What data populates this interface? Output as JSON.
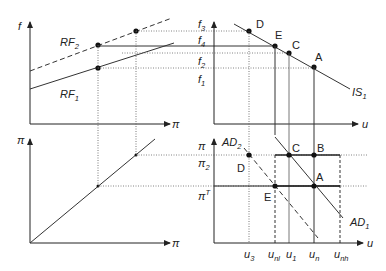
{
  "panels": {
    "top_left": {
      "y_axis": "f",
      "x_axis": "π",
      "curves": [
        {
          "name": "RF",
          "sub": "2",
          "style": "dashed"
        },
        {
          "name": "RF",
          "sub": "1",
          "style": "solid"
        }
      ]
    },
    "top_right": {
      "x_axis": "u",
      "y_ticks": [
        {
          "name": "f",
          "sub": "3"
        },
        {
          "name": "f",
          "sub": "4"
        },
        {
          "name": "f",
          "sub": "2"
        },
        {
          "name": "f",
          "sub": "1"
        }
      ],
      "curve": {
        "name": "IS",
        "sub": "1"
      },
      "points": [
        "D",
        "E",
        "C",
        "A"
      ]
    },
    "bottom_left": {
      "y_axis": "π",
      "x_axis": "π"
    },
    "bottom_right": {
      "x_axis": "u",
      "y_ticks": [
        {
          "name": "π",
          "sub": ""
        },
        {
          "name": "π",
          "sub": "2"
        },
        {
          "name": "π",
          "sup": "T"
        }
      ],
      "curves": [
        {
          "name": "AD",
          "sub": "2",
          "style": "dashed"
        },
        {
          "name": "AD",
          "sub": "1",
          "style": "solid"
        }
      ],
      "points": [
        "C",
        "B",
        "D",
        "A",
        "E"
      ],
      "x_ticks": [
        {
          "name": "u",
          "sub": "3"
        },
        {
          "name": "u",
          "sub": "nl"
        },
        {
          "name": "u",
          "sub": "1"
        },
        {
          "name": "u",
          "sub": "n"
        },
        {
          "name": "u",
          "sub": "nh"
        }
      ]
    }
  },
  "colors": {
    "line": "#333333",
    "dotted": "#555555",
    "bg": "#ffffff"
  }
}
